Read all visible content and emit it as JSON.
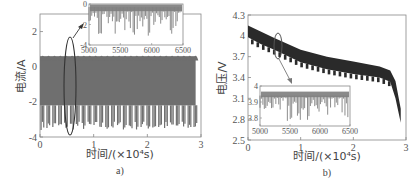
{
  "chart_data": [
    {
      "id": "a",
      "type": "line",
      "caption": "a)",
      "title": "",
      "xlabel": "时间/(×10⁴s)",
      "ylabel": "电流/A",
      "xlim": [
        0,
        3
      ],
      "ylim": [
        -4,
        3
      ],
      "xticks": [
        "0",
        "1",
        "2",
        "3"
      ],
      "yticks": [
        "-4",
        "-2",
        "0",
        "2"
      ],
      "grid": false,
      "description": "Periodic current pulses oscillating between about 0.6 A and -3.6 A across the full 0–2.9×10⁴ s range, ~27 repeated cycles",
      "series": [
        {
          "name": "current",
          "color": "#707070",
          "envelope": {
            "upper": 0.6,
            "lower_typical": -2.2,
            "lower_peaks": -3.6
          },
          "x": [
            0,
            0.5,
            1.0,
            1.5,
            2.0,
            2.5,
            2.9
          ],
          "y_upper": [
            0.6,
            0.6,
            0.6,
            0.6,
            0.6,
            0.6,
            0.6
          ],
          "y_lower": [
            -3.6,
            -3.6,
            -3.6,
            -3.6,
            -3.6,
            -3.6,
            -3.6
          ]
        }
      ],
      "annotation": {
        "type": "ellipse",
        "x_center": 0.6,
        "y_range": [
          -3.8,
          1.0
        ],
        "arrow_to": "inset"
      },
      "inset": {
        "xlim": [
          5000,
          6500
        ],
        "ylim": [
          -4,
          0
        ],
        "xticks": [
          "5000",
          "5500",
          "6000",
          "6500"
        ],
        "yticks": [
          "-4",
          "-2",
          "0"
        ],
        "description": "Zoomed current trace, baseline near 0 A with downward spikes to about -3 A"
      }
    },
    {
      "id": "b",
      "type": "line",
      "caption": "b)",
      "title": "",
      "xlabel": "时间/(×10⁴s)",
      "ylabel": "电压/V",
      "xlim": [
        0,
        3
      ],
      "ylim": [
        2.5,
        4.3
      ],
      "xticks": [
        "0",
        "1",
        "2",
        "3"
      ],
      "yticks": [
        "2.5",
        "2.8",
        "3.1",
        "3.4",
        "3.7",
        "4",
        "4.3"
      ],
      "grid": false,
      "description": "Battery voltage discharge curve with periodic dips: starts ~4.15 V, decreases to ~3.55 V near 2.7×10⁴ s, then drops sharply to ~2.75 V at 2.9×10⁴ s",
      "series": [
        {
          "name": "voltage_upper",
          "color": "#2a2a2a",
          "x": [
            0,
            0.25,
            0.5,
            1.0,
            1.5,
            2.0,
            2.5,
            2.7,
            2.8,
            2.9
          ],
          "y": [
            4.15,
            4.06,
            3.97,
            3.8,
            3.7,
            3.63,
            3.56,
            3.5,
            3.35,
            2.95
          ]
        },
        {
          "name": "voltage_lower",
          "color": "#2a2a2a",
          "x": [
            0,
            0.25,
            0.5,
            1.0,
            1.5,
            2.0,
            2.5,
            2.7,
            2.8,
            2.9
          ],
          "y": [
            3.98,
            3.88,
            3.8,
            3.62,
            3.52,
            3.45,
            3.4,
            3.34,
            3.1,
            2.75
          ]
        }
      ],
      "annotation": {
        "type": "ellipse",
        "x_center": 0.55,
        "y_range": [
          3.75,
          4.0
        ],
        "arrow_to": "inset"
      },
      "inset": {
        "xlim": [
          5000,
          6500
        ],
        "ylim": [
          3.75,
          4.0
        ],
        "xticks": [
          "5000",
          "5500",
          "6000",
          "6500"
        ],
        "yticks": [
          "3.8",
          "3.9",
          "4"
        ],
        "description": "Zoomed voltage trace, baseline ~3.95 V with downward spikes to ~3.78 V"
      }
    }
  ]
}
